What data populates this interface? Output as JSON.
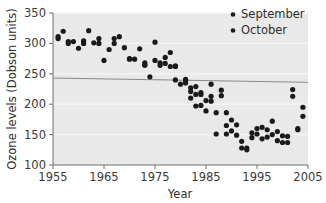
{
  "chart_data": {
    "type": "scatter",
    "title": "",
    "xlabel": "Year",
    "ylabel": "Ozone levels (Dobson units)",
    "xlim": [
      1955,
      2005
    ],
    "ylim": [
      100,
      350
    ],
    "xticks": [
      1955,
      1965,
      1975,
      1985,
      1995,
      2005
    ],
    "yticks": [
      100,
      150,
      200,
      250,
      300,
      350
    ],
    "grid": "horizontal-light",
    "legend_position": "top-right",
    "marker_color": "#1a1a1a",
    "plot_background": "#e9e9e9",
    "gridline_color": "#f5f5f5",
    "axis_color": "#6e6e6e",
    "trendline": {
      "visible": true,
      "color": "#8a8a8a",
      "x_start": 1955,
      "y_start": 243,
      "x_end": 2005,
      "y_end": 236
    },
    "series": [
      {
        "name": "September",
        "color": "#1a1a1a",
        "points": [
          [
            1956,
            311
          ],
          [
            1957,
            320
          ],
          [
            1958,
            303
          ],
          [
            1959,
            303
          ],
          [
            1960,
            292
          ],
          [
            1961,
            304
          ],
          [
            1962,
            321
          ],
          [
            1963,
            301
          ],
          [
            1964,
            308
          ],
          [
            1965,
            272
          ],
          [
            1966,
            290
          ],
          [
            1967,
            308
          ],
          [
            1968,
            311
          ],
          [
            1969,
            293
          ],
          [
            1970,
            274
          ],
          [
            1971,
            274
          ],
          [
            1972,
            291
          ],
          [
            1973,
            265
          ],
          [
            1973,
            268
          ],
          [
            1974,
            245
          ],
          [
            1975,
            302
          ],
          [
            1975,
            272
          ],
          [
            1976,
            268
          ],
          [
            1977,
            277
          ],
          [
            1977,
            267
          ],
          [
            1978,
            285
          ],
          [
            1978,
            262
          ],
          [
            1979,
            263
          ],
          [
            1979,
            240
          ],
          [
            1980,
            233
          ],
          [
            1981,
            241
          ],
          [
            1981,
            239
          ],
          [
            1982,
            227
          ],
          [
            1982,
            210
          ],
          [
            1983,
            229
          ],
          [
            1983,
            197
          ],
          [
            1984,
            219
          ],
          [
            1984,
            216
          ],
          [
            1985,
            206
          ],
          [
            1985,
            189
          ],
          [
            1986,
            233
          ],
          [
            1986,
            213
          ],
          [
            1987,
            151
          ],
          [
            1988,
            223
          ],
          [
            1988,
            214
          ],
          [
            1989,
            186
          ],
          [
            1989,
            151
          ],
          [
            1990,
            174
          ],
          [
            1991,
            166
          ],
          [
            1992,
            139
          ],
          [
            1993,
            125
          ],
          [
            1993,
            128
          ],
          [
            1994,
            153
          ],
          [
            1995,
            151
          ],
          [
            1996,
            162
          ],
          [
            1997,
            158
          ],
          [
            1998,
            172
          ],
          [
            1999,
            155
          ],
          [
            2000,
            148
          ],
          [
            2001,
            137
          ],
          [
            2002,
            224
          ],
          [
            2002,
            213
          ],
          [
            2003,
            160
          ],
          [
            2004,
            195
          ]
        ]
      },
      {
        "name": "October",
        "color": "#1a1a1a",
        "points": [
          [
            1956,
            308
          ],
          [
            1958,
            300
          ],
          [
            1961,
            300
          ],
          [
            1964,
            300
          ],
          [
            1967,
            300
          ],
          [
            1970,
            275
          ],
          [
            1973,
            264
          ],
          [
            1976,
            264
          ],
          [
            1979,
            262
          ],
          [
            1981,
            235
          ],
          [
            1982,
            221
          ],
          [
            1983,
            216
          ],
          [
            1984,
            198
          ],
          [
            1986,
            205
          ],
          [
            1987,
            186
          ],
          [
            1989,
            165
          ],
          [
            1990,
            156
          ],
          [
            1991,
            149
          ],
          [
            1992,
            128
          ],
          [
            1994,
            145
          ],
          [
            1995,
            160
          ],
          [
            1996,
            143
          ],
          [
            1997,
            146
          ],
          [
            1998,
            150
          ],
          [
            1999,
            140
          ],
          [
            2000,
            137
          ],
          [
            2001,
            147
          ],
          [
            2003,
            158
          ],
          [
            2004,
            180
          ]
        ]
      }
    ]
  },
  "legend": {
    "items": [
      {
        "label": "September"
      },
      {
        "label": "October"
      }
    ]
  },
  "axes": {
    "x": {
      "title": "Year",
      "tick_labels": [
        "1955",
        "1965",
        "1975",
        "1985",
        "1995",
        "2005"
      ]
    },
    "y": {
      "title": "Ozone levels (Dobson units)",
      "tick_labels": [
        "100",
        "150",
        "200",
        "250",
        "300",
        "350"
      ]
    }
  }
}
